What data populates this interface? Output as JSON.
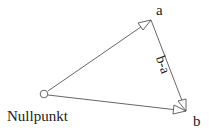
{
  "diagram": {
    "points": {
      "origin": {
        "label": "Nullpunkt",
        "x": 44,
        "y": 94
      },
      "a": {
        "label": "a",
        "x": 151,
        "y": 20
      },
      "b": {
        "label": "b",
        "x": 186,
        "y": 111
      }
    },
    "edges": [
      {
        "from": "origin",
        "to": "a",
        "arrow": "open-triangle"
      },
      {
        "from": "origin",
        "to": "b",
        "arrow": "open-triangle"
      },
      {
        "from": "a",
        "to": "b",
        "arrow": "open-triangle",
        "label": "b-a"
      }
    ],
    "labels": {
      "a": "a",
      "b": "b",
      "origin": "Nullpunkt",
      "difference": "b-a"
    },
    "colors": {
      "line": "#555555",
      "text": "#222222",
      "background": "#ffffff"
    }
  }
}
